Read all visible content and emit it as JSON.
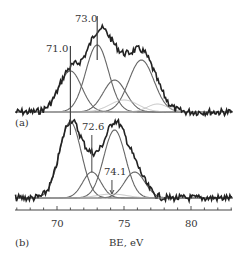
{
  "chart_data": {
    "type": "line",
    "title": "",
    "xlabel": "BE, eV",
    "ylabel": "",
    "xlim": [
      66.9,
      83.1
    ],
    "x_ticks": [
      70,
      75,
      80
    ],
    "x_tick_labels": [
      "70",
      "75",
      "80"
    ],
    "grid": false,
    "legend": null,
    "panels": [
      {
        "label": "(a)",
        "annotations": [
          {
            "text": "73.0",
            "x": 73.0
          },
          {
            "text": "71.0",
            "x": 71.0
          }
        ],
        "baseline": 0,
        "components": [
          {
            "center": 71.0,
            "height": 41,
            "fwhm": 2.0
          },
          {
            "center": 73.0,
            "height": 67,
            "fwhm": 2.0
          },
          {
            "center": 74.3,
            "height": 32,
            "fwhm": 2.0
          },
          {
            "center": 76.3,
            "height": 52,
            "fwhm": 2.2
          },
          {
            "center": 75.0,
            "height": 12,
            "fwhm": 2.5,
            "style": "light"
          },
          {
            "center": 77.5,
            "height": 8,
            "fwhm": 1.8,
            "style": "light"
          }
        ],
        "experimental_peak_height": 85
      },
      {
        "label": "(b)",
        "annotations": [
          {
            "text": "72.6",
            "x": 72.6
          },
          {
            "text": "74.1",
            "x": 74.1
          }
        ],
        "baseline": 0,
        "components": [
          {
            "center": 71.0,
            "height": 76,
            "fwhm": 1.9
          },
          {
            "center": 72.6,
            "height": 26,
            "fwhm": 1.6
          },
          {
            "center": 74.3,
            "height": 68,
            "fwhm": 1.9
          },
          {
            "center": 75.8,
            "height": 26,
            "fwhm": 1.8
          },
          {
            "center": 74.1,
            "height": 4,
            "fwhm": 2.6,
            "style": "light"
          }
        ],
        "experimental_peak_height": 78
      }
    ]
  },
  "labels": {
    "panel_a": "(a)",
    "panel_b": "(b)",
    "xlabel": "BE, eV",
    "tick_70": "70",
    "tick_75": "75",
    "tick_80": "80",
    "ann_a1": "73.0",
    "ann_a2": "71.0",
    "ann_b1": "72.6",
    "ann_b2": "74.1"
  }
}
